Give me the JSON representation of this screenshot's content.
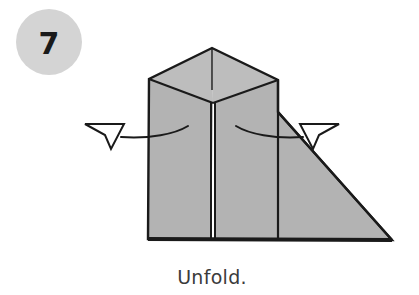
{
  "figure": {
    "kind": "origami-instruction-diagram",
    "width": 419,
    "height": 295,
    "background_color": "#ffffff"
  },
  "step_badge": {
    "number": "7",
    "circle_fill": "#d4d4d4",
    "number_color": "#1a1a1a",
    "center_x": 49,
    "center_y": 42,
    "radius": 33
  },
  "caption": {
    "text": "Unfold.",
    "color": "#3b3b3b",
    "center_x": 212,
    "baseline_y": 284
  },
  "model": {
    "paper_fill": "#b3b3b3",
    "paper_fill_light": "#bdbdbd",
    "outline_color": "#1a1a1a",
    "fold_line_color": "#1a1a1a",
    "shapes": {
      "top_face_left": "149,79 212,48 213,103",
      "top_face_right": "212,48 278,80 213,103",
      "body_left_panel": "149,79 213,103 211,239 148,239",
      "body_right_panel": "215,239 215,103 278,80 278,239",
      "right_triangle_flap": "278,112 392,240 278,240",
      "bottom_edge": "148,239 392,240"
    },
    "fold_lines": {
      "center_seam_left_x": 211,
      "center_seam_right_x": 215,
      "center_seam_top_y": 103,
      "center_seam_bottom_y": 239,
      "right_vertical_x": 278,
      "right_vertical_top_y": 80,
      "right_vertical_bottom_y": 239,
      "apex_tick": "212,48 212,90"
    }
  },
  "arrows": [
    {
      "name": "unfold-arrow-left",
      "direction": "left",
      "description": "curved arrow pointing outward to the left",
      "tail_path": "M 188,126 C 175,134 150,139 121,137",
      "head_points": "85,124 124,124 111,149 105,135",
      "stroke_color": "#1a1a1a",
      "fill_color": "#ffffff"
    },
    {
      "name": "unfold-arrow-right",
      "direction": "right",
      "description": "curved arrow pointing outward to the right",
      "tail_path": "M 236,126 C 249,134 274,139 303,137",
      "head_points": "339,124 300,124 313,149 319,135",
      "stroke_color": "#1a1a1a",
      "fill_color": "#ffffff"
    }
  ]
}
